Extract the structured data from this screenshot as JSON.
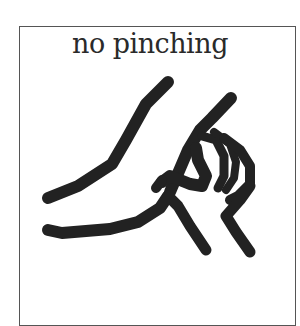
{
  "card": {
    "caption": "no pinching",
    "pictogram": "pinching-hand-icon",
    "stroke_color": "#222222",
    "border_color": "#555555"
  }
}
